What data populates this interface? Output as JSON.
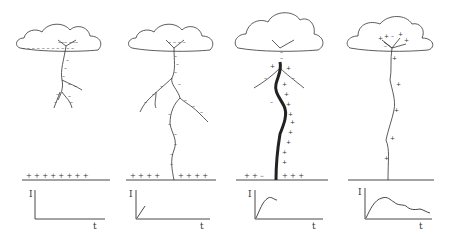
{
  "diagram": {
    "title": "",
    "panels": [
      {
        "stage": "stepped-leader",
        "ground_charges": "+ + + + + + + +",
        "graph": {
          "y_label": "I",
          "x_label": "t",
          "curve": "none"
        }
      },
      {
        "stage": "leader-approaching-ground",
        "ground_charges": "+ + + +   + + + +",
        "graph": {
          "y_label": "I",
          "x_label": "t",
          "curve": "short-rise"
        }
      },
      {
        "stage": "return-stroke",
        "ground_charges": "+ + −   + + +",
        "graph": {
          "y_label": "I",
          "x_label": "t",
          "curve": "rise-peak"
        }
      },
      {
        "stage": "continuing-current",
        "ground_charges": "",
        "graph": {
          "y_label": "I",
          "x_label": "t",
          "curve": "rise-peak-decay"
        }
      }
    ],
    "colors": {
      "ink": "#333333",
      "background": "#ffffff"
    }
  }
}
